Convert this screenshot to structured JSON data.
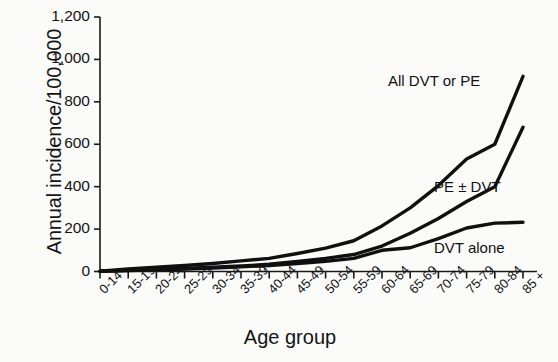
{
  "chart_data": {
    "type": "line",
    "title": "",
    "xlabel": "Age group",
    "ylabel": "Annual incidence/100,000",
    "categories": [
      "0-14",
      "15-19",
      "20-24",
      "25-29",
      "30-34",
      "35-39",
      "40-44",
      "45-49",
      "50-54",
      "55-59",
      "60-64",
      "65-69",
      "70-74",
      "75-79",
      "80-84",
      "85 +"
    ],
    "ylim": [
      0,
      1200
    ],
    "yticks": [
      0,
      200,
      400,
      600,
      800,
      1000,
      1200
    ],
    "ytick_labels": [
      "0",
      "200",
      "400",
      "600",
      "800",
      "1,000",
      "1,200"
    ],
    "grid": false,
    "legend_position": "inline-right",
    "series": [
      {
        "name": "All DVT or PE",
        "values": [
          2,
          12,
          20,
          28,
          38,
          50,
          62,
          85,
          110,
          145,
          215,
          300,
          405,
          530,
          600,
          920
        ]
      },
      {
        "name": "PE ± DVT",
        "values": [
          1,
          6,
          10,
          14,
          20,
          26,
          34,
          48,
          62,
          80,
          120,
          180,
          250,
          330,
          400,
          680
        ]
      },
      {
        "name": "DVT alone",
        "values": [
          1,
          5,
          8,
          12,
          16,
          22,
          28,
          38,
          48,
          62,
          100,
          112,
          155,
          205,
          228,
          232
        ]
      }
    ]
  },
  "axis": {
    "ylabel": "Annual incidence/100,000",
    "xlabel": "Age group"
  },
  "series_labels": {
    "top": "All DVT or PE",
    "middle": "PE ± DVT",
    "bottom": "DVT alone"
  },
  "style": {
    "line_color": "#101010",
    "axis_color": "#1a1a1a",
    "background": "#fbfbfa"
  }
}
